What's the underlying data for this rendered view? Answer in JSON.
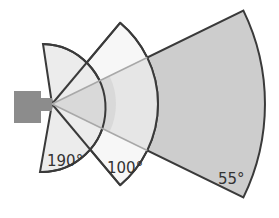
{
  "diagram": {
    "apex": {
      "x": 52,
      "y": 104
    },
    "camera": {
      "color": "#8c8c8c"
    },
    "sectors": [
      {
        "id": "wide",
        "label": "190°",
        "angle_deg": 190,
        "radius": 64,
        "fill": "#ececec",
        "cone_fill": "#d9d9d9"
      },
      {
        "id": "medium",
        "label": "100°",
        "angle_deg": 100,
        "radius": 106,
        "fill": "#f7f7f7",
        "cone_fill": "#e6e6e6"
      },
      {
        "id": "narrow",
        "label": "55°",
        "angle_deg": 55,
        "radius": 213,
        "fill": "#cdcdcd"
      }
    ],
    "outline_color": "#3a3a3a",
    "cone_line_color": "#a8a8a8"
  }
}
